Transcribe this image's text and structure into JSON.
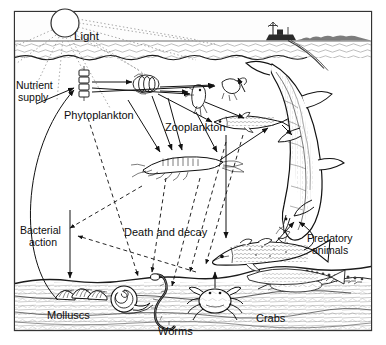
{
  "figure": {
    "kind": "marine-food-web-diagram",
    "frame": {
      "x": 14,
      "y": 11,
      "w": 358,
      "h": 320,
      "border_color": "#333333",
      "background": "#ffffff"
    }
  },
  "labels": [
    {
      "id": "light",
      "text": "Light",
      "x": 74,
      "y": 30,
      "size": 11.5,
      "align": "left"
    },
    {
      "id": "nutrient",
      "text": "Nutrient",
      "x": 16,
      "y": 80,
      "size": 10.5,
      "align": "left"
    },
    {
      "id": "supply",
      "text": "supply",
      "x": 18,
      "y": 92,
      "size": 10.5,
      "align": "left"
    },
    {
      "id": "phytoplankton",
      "text": "Phytoplankton",
      "x": 64,
      "y": 110,
      "size": 11,
      "align": "left"
    },
    {
      "id": "zooplankton",
      "text": "Zooplankton",
      "x": 165,
      "y": 122,
      "size": 11,
      "align": "left"
    },
    {
      "id": "bacterial",
      "text": "Bacterial",
      "x": 20,
      "y": 225,
      "size": 10.5,
      "align": "left"
    },
    {
      "id": "action",
      "text": "action",
      "x": 29,
      "y": 237,
      "size": 10.5,
      "align": "left"
    },
    {
      "id": "death",
      "text": "Death and decay",
      "x": 124,
      "y": 227,
      "size": 11,
      "align": "left"
    },
    {
      "id": "predatory",
      "text": "Predatory",
      "x": 307,
      "y": 233,
      "size": 10.5,
      "align": "left"
    },
    {
      "id": "animals",
      "text": "animals",
      "x": 312,
      "y": 245,
      "size": 10.5,
      "align": "left"
    },
    {
      "id": "molluscs",
      "text": "Molluscs",
      "x": 47,
      "y": 310,
      "size": 11,
      "align": "left"
    },
    {
      "id": "worms",
      "text": "Worms",
      "x": 158,
      "y": 326,
      "size": 11,
      "align": "left"
    },
    {
      "id": "crabs",
      "text": "Crabs",
      "x": 256,
      "y": 313,
      "size": 11,
      "align": "left"
    }
  ],
  "scene": {
    "sky": {
      "label": "sky-band",
      "y": 11,
      "h": 30
    },
    "sun": {
      "cx": 65,
      "cy": 23,
      "r": 14,
      "label": "sun"
    },
    "horizon_y": 41,
    "sea_surface_y": 56,
    "seabed_y": 279,
    "ship": {
      "x": 272,
      "y": 33,
      "label": "fishing-ship"
    },
    "shoreline": {
      "x": 300,
      "y": 36,
      "label": "distant-land"
    }
  },
  "organisms": [
    {
      "id": "phyto-a",
      "name": "phytoplankton-chain-left",
      "x": 84,
      "y": 84
    },
    {
      "id": "phyto-b",
      "name": "phytoplankton-cluster-right",
      "x": 145,
      "y": 80
    },
    {
      "id": "copepod",
      "name": "copepod-zooplankton",
      "x": 196,
      "y": 96
    },
    {
      "id": "larva",
      "name": "larval-zooplankton",
      "x": 230,
      "y": 84
    },
    {
      "id": "krill",
      "name": "krill-shrimp",
      "x": 180,
      "y": 165
    },
    {
      "id": "smallfish",
      "name": "small-fish-herring",
      "x": 247,
      "y": 120
    },
    {
      "id": "bigfish",
      "name": "bottom-fish-cod",
      "x": 255,
      "y": 250
    },
    {
      "id": "shark",
      "name": "predatory-shark",
      "x": 310,
      "y": 150
    },
    {
      "id": "mollusc",
      "name": "mollusc-shells",
      "x": 75,
      "y": 295
    },
    {
      "id": "snail",
      "name": "sea-snail",
      "x": 118,
      "y": 300
    },
    {
      "id": "worm",
      "name": "seabed-worm",
      "x": 150,
      "y": 300
    },
    {
      "id": "crab",
      "name": "seabed-crab",
      "x": 215,
      "y": 305
    }
  ],
  "flows": {
    "light_rays_label": "sunlight-dotted-rays",
    "feeding_label": "feeding-arrow",
    "decay_label": "death-and-decay-dashed-arrow",
    "nutrient_label": "nutrient-recycle-arc"
  },
  "colors": {
    "ink": "#121212",
    "frame": "#333333",
    "dotted_ray": "#9a9a9a",
    "dashed_decay": "#1a1a1a",
    "water_tint": "#ffffff"
  }
}
